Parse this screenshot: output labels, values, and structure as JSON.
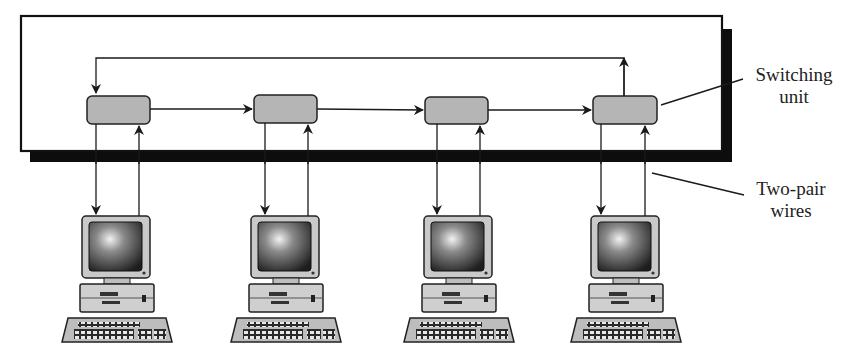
{
  "figure": {
    "caption_partial": "",
    "labels": {
      "switching_unit": [
        "Switching",
        "unit"
      ],
      "two_pair_wires": [
        "Two-pair",
        "wires"
      ]
    },
    "switching_units": [
      {
        "id": 1,
        "x": 87,
        "y": 96,
        "w": 63,
        "h": 28
      },
      {
        "id": 2,
        "x": 254,
        "y": 95,
        "w": 63,
        "h": 28
      },
      {
        "id": 3,
        "x": 425,
        "y": 97,
        "w": 63,
        "h": 27
      },
      {
        "id": 4,
        "x": 593,
        "y": 96,
        "w": 64,
        "h": 28
      }
    ],
    "stations": [
      {
        "id": 1,
        "x": 62
      },
      {
        "id": 2,
        "x": 231
      },
      {
        "id": 3,
        "x": 404
      },
      {
        "id": 4,
        "x": 571
      }
    ],
    "colors": {
      "unit_fill": "#b5b5b5",
      "line": "#1a1a1a",
      "shadow": "#0d0d0d"
    }
  }
}
